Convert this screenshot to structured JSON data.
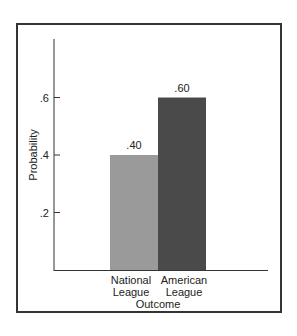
{
  "chart_data": {
    "type": "bar",
    "title": "",
    "xlabel": "Outcome",
    "ylabel": "Probability",
    "categories": [
      "National League",
      "American League"
    ],
    "category_lines": [
      [
        "National",
        "League"
      ],
      [
        "American",
        "League"
      ]
    ],
    "values": [
      0.4,
      0.6
    ],
    "data_labels": [
      ".40",
      ".60"
    ],
    "yticks": [
      0.2,
      0.4,
      0.6
    ],
    "ytick_labels": [
      ".2",
      ".4",
      ".6"
    ],
    "ylim": [
      0,
      0.8
    ],
    "grid": false,
    "legend": null,
    "colors": [
      "#9a9a9a",
      "#4a4a4a"
    ]
  }
}
